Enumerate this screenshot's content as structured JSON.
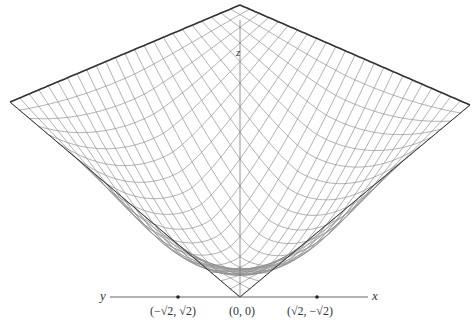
{
  "figure": {
    "colors": {
      "mesh": "#8a8a8a",
      "outline": "#333333",
      "axis": "#555555",
      "background": "#ffffff"
    }
  },
  "axes": {
    "x_label": "x",
    "y_label": "y",
    "z_label": "z"
  },
  "points": [
    {
      "label": "(−√2, √2)",
      "marked": true
    },
    {
      "label": "(0, 0)",
      "marked": false
    },
    {
      "label": "(√2, −√2)",
      "marked": true
    }
  ]
}
